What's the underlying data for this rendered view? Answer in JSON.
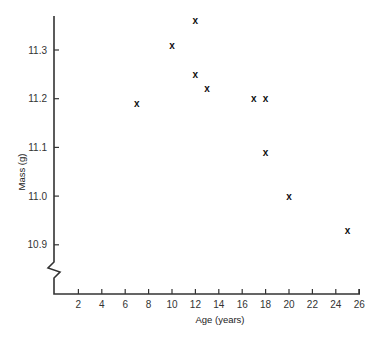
{
  "chart_data": {
    "type": "scatter",
    "title": "",
    "xlabel": "Age (years)",
    "ylabel": "Mass (g)",
    "xlim": [
      0,
      26
    ],
    "ylim": [
      10.83,
      11.38
    ],
    "x_ticks": [
      2,
      4,
      6,
      8,
      10,
      12,
      14,
      16,
      18,
      20,
      22,
      24,
      26
    ],
    "y_ticks": [
      10.9,
      11.0,
      11.1,
      11.2,
      11.3
    ],
    "y_tick_labels": [
      "10.9",
      "11.0",
      "11.1",
      "11.2",
      "11.3"
    ],
    "y_axis_break": true,
    "grid": false,
    "marker": "x",
    "points": [
      {
        "x": 7,
        "y": 11.19
      },
      {
        "x": 10,
        "y": 11.31
      },
      {
        "x": 12,
        "y": 11.36
      },
      {
        "x": 12,
        "y": 11.25
      },
      {
        "x": 13,
        "y": 11.22
      },
      {
        "x": 17,
        "y": 11.2
      },
      {
        "x": 18,
        "y": 11.2
      },
      {
        "x": 18,
        "y": 11.09
      },
      {
        "x": 20,
        "y": 11.0
      },
      {
        "x": 25,
        "y": 10.93
      }
    ]
  }
}
